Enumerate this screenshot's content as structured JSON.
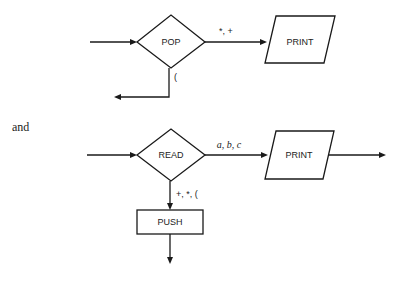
{
  "diagram_top": {
    "decision": "POP",
    "right_edge_label": "*, +",
    "output_box": "PRINT",
    "down_edge_label": "("
  },
  "connector_text": "and",
  "diagram_bottom": {
    "decision": "READ",
    "right_edge_label": "a, b, c",
    "output_box": "PRINT",
    "down_edge_label": "+, *, (",
    "process_box": "PUSH"
  },
  "colors": {
    "line": "#1a1a1a",
    "background": "#ffffff"
  }
}
